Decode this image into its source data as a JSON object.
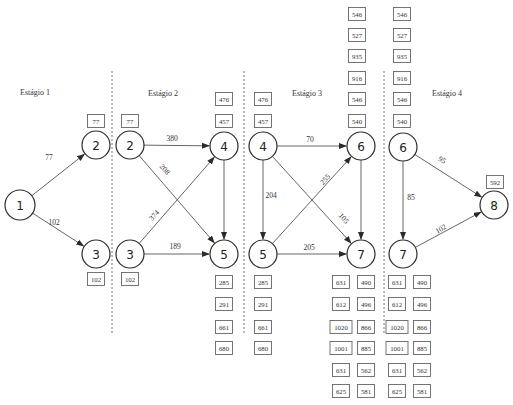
{
  "stages": [
    {
      "label": "Estágio 1",
      "x": 35,
      "y": 95
    },
    {
      "label": "Estágio 2",
      "x": 163,
      "y": 96
    },
    {
      "label": "Estágio 3",
      "x": 307,
      "y": 96
    },
    {
      "label": "Estágio 4",
      "x": 447,
      "y": 96
    }
  ],
  "dividers": [
    {
      "x": 112,
      "y1": 71,
      "y2": 334
    },
    {
      "x": 244,
      "y1": 71,
      "y2": 334
    },
    {
      "x": 384,
      "y1": 71,
      "y2": 334
    }
  ],
  "nodes": [
    {
      "id": "n1",
      "label": "1",
      "x": 20,
      "y": 205,
      "r": 15
    },
    {
      "id": "n2a",
      "label": "2",
      "x": 96,
      "y": 145,
      "r": 14
    },
    {
      "id": "n3a",
      "label": "3",
      "x": 96,
      "y": 254,
      "r": 14
    },
    {
      "id": "n2b",
      "label": "2",
      "x": 130,
      "y": 145,
      "r": 14
    },
    {
      "id": "n3b",
      "label": "3",
      "x": 130,
      "y": 254,
      "r": 14
    },
    {
      "id": "n4a",
      "label": "4",
      "x": 224,
      "y": 146,
      "r": 14
    },
    {
      "id": "n5a",
      "label": "5",
      "x": 224,
      "y": 254,
      "r": 14
    },
    {
      "id": "n4b",
      "label": "4",
      "x": 263,
      "y": 146,
      "r": 14
    },
    {
      "id": "n5b",
      "label": "5",
      "x": 263,
      "y": 254,
      "r": 14
    },
    {
      "id": "n6a",
      "label": "6",
      "x": 361,
      "y": 146,
      "r": 14
    },
    {
      "id": "n7a",
      "label": "7",
      "x": 361,
      "y": 254,
      "r": 14
    },
    {
      "id": "n6b",
      "label": "6",
      "x": 403,
      "y": 147,
      "r": 14
    },
    {
      "id": "n7b",
      "label": "7",
      "x": 403,
      "y": 254,
      "r": 14
    },
    {
      "id": "n8",
      "label": "8",
      "x": 494,
      "y": 205,
      "r": 14
    }
  ],
  "edges": [
    {
      "from": "n1",
      "to": "n2a",
      "label": "77",
      "lx": 49,
      "ly": 160,
      "rot": 0
    },
    {
      "from": "n1",
      "to": "n3a",
      "label": "102",
      "lx": 54,
      "ly": 225,
      "rot": 0
    },
    {
      "from": "n2b",
      "to": "n4a",
      "label": "380",
      "lx": 172,
      "ly": 141,
      "rot": 0
    },
    {
      "from": "n2b",
      "to": "n5a",
      "label": "208",
      "lx": 163,
      "ly": 171,
      "rot": 48
    },
    {
      "from": "n3b",
      "to": "n4a",
      "label": "374",
      "lx": 156,
      "ly": 217,
      "rot": -48
    },
    {
      "from": "n3b",
      "to": "n5a",
      "label": "189",
      "lx": 175,
      "ly": 249,
      "rot": 0
    },
    {
      "from": "n4a",
      "to": "n5a",
      "label": "",
      "lx": 0,
      "ly": 0,
      "rot": 0
    },
    {
      "from": "n4b",
      "to": "n6a",
      "label": "70",
      "lx": 310,
      "ly": 142,
      "rot": 0
    },
    {
      "from": "n4b",
      "to": "n5b",
      "label": "204",
      "lx": 271,
      "ly": 198,
      "rot": 0
    },
    {
      "from": "n4b",
      "to": "n7a",
      "label": "105",
      "lx": 342,
      "ly": 220,
      "rot": 48
    },
    {
      "from": "n5b",
      "to": "n6a",
      "label": "255",
      "lx": 327,
      "ly": 181,
      "rot": -48
    },
    {
      "from": "n5b",
      "to": "n7a",
      "label": "205",
      "lx": 309,
      "ly": 250,
      "rot": 0
    },
    {
      "from": "n6a",
      "to": "n7a",
      "label": "",
      "lx": 0,
      "ly": 0,
      "rot": 0
    },
    {
      "from": "n6b",
      "to": "n7b",
      "label": "85",
      "lx": 411,
      "ly": 200,
      "rot": 0
    },
    {
      "from": "n6b",
      "to": "n8",
      "label": "95",
      "lx": 441,
      "ly": 162,
      "rot": 30
    },
    {
      "from": "n7b",
      "to": "n8",
      "label": "102",
      "lx": 442,
      "ly": 231,
      "rot": -30
    }
  ],
  "value_boxes": [
    {
      "value": "77",
      "x": 96,
      "y": 121
    },
    {
      "value": "102",
      "x": 96,
      "y": 279
    },
    {
      "value": "77",
      "x": 130,
      "y": 121
    },
    {
      "value": "102",
      "x": 130,
      "y": 279
    },
    {
      "value": "476",
      "x": 224,
      "y": 99
    },
    {
      "value": "457",
      "x": 224,
      "y": 121
    },
    {
      "value": "285",
      "x": 224,
      "y": 282
    },
    {
      "value": "291",
      "x": 224,
      "y": 304
    },
    {
      "value": "661",
      "x": 224,
      "y": 327
    },
    {
      "value": "680",
      "x": 224,
      "y": 348
    },
    {
      "value": "476",
      "x": 263,
      "y": 99
    },
    {
      "value": "457",
      "x": 263,
      "y": 121
    },
    {
      "value": "285",
      "x": 263,
      "y": 282
    },
    {
      "value": "291",
      "x": 263,
      "y": 304
    },
    {
      "value": "661",
      "x": 263,
      "y": 327
    },
    {
      "value": "680",
      "x": 263,
      "y": 348
    },
    {
      "value": "546",
      "x": 357,
      "y": 14
    },
    {
      "value": "527",
      "x": 357,
      "y": 35
    },
    {
      "value": "935",
      "x": 357,
      "y": 56
    },
    {
      "value": "916",
      "x": 357,
      "y": 78
    },
    {
      "value": "546",
      "x": 357,
      "y": 99
    },
    {
      "value": "540",
      "x": 357,
      "y": 121
    },
    {
      "value": "546",
      "x": 402,
      "y": 14
    },
    {
      "value": "527",
      "x": 402,
      "y": 35
    },
    {
      "value": "935",
      "x": 402,
      "y": 56
    },
    {
      "value": "916",
      "x": 402,
      "y": 78
    },
    {
      "value": "546",
      "x": 402,
      "y": 99
    },
    {
      "value": "540",
      "x": 402,
      "y": 121
    },
    {
      "value": "631",
      "x": 341,
      "y": 282
    },
    {
      "value": "612",
      "x": 341,
      "y": 304
    },
    {
      "value": "1020",
      "x": 341,
      "y": 327
    },
    {
      "value": "1001",
      "x": 341,
      "y": 348
    },
    {
      "value": "631",
      "x": 341,
      "y": 370
    },
    {
      "value": "625",
      "x": 341,
      "y": 391
    },
    {
      "value": "490",
      "x": 366,
      "y": 282
    },
    {
      "value": "496",
      "x": 366,
      "y": 304
    },
    {
      "value": "866",
      "x": 366,
      "y": 327
    },
    {
      "value": "885",
      "x": 366,
      "y": 348
    },
    {
      "value": "562",
      "x": 366,
      "y": 370
    },
    {
      "value": "581",
      "x": 366,
      "y": 391
    },
    {
      "value": "631",
      "x": 397,
      "y": 282
    },
    {
      "value": "612",
      "x": 397,
      "y": 304
    },
    {
      "value": "1020",
      "x": 397,
      "y": 327
    },
    {
      "value": "1001",
      "x": 397,
      "y": 348
    },
    {
      "value": "631",
      "x": 397,
      "y": 370
    },
    {
      "value": "625",
      "x": 397,
      "y": 391
    },
    {
      "value": "490",
      "x": 422,
      "y": 282
    },
    {
      "value": "496",
      "x": 422,
      "y": 304
    },
    {
      "value": "866",
      "x": 422,
      "y": 327
    },
    {
      "value": "885",
      "x": 422,
      "y": 348
    },
    {
      "value": "562",
      "x": 422,
      "y": 370
    },
    {
      "value": "581",
      "x": 422,
      "y": 391
    },
    {
      "value": "592",
      "x": 495,
      "y": 182
    }
  ],
  "colors": {
    "stroke": "#2b2b2b",
    "edge": "#555555",
    "box": "#666666",
    "divider": "#777777",
    "background": "#ffffff"
  }
}
